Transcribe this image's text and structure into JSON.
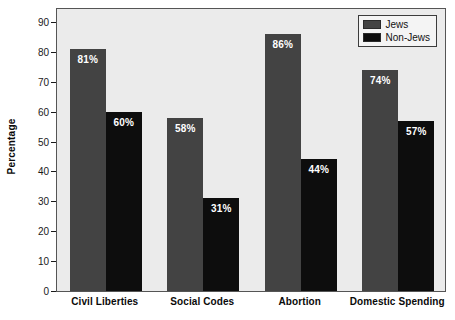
{
  "chart_data": {
    "type": "bar",
    "title": "",
    "xlabel": "",
    "ylabel": "Percentage",
    "ylim": [
      0,
      95
    ],
    "yticks": [
      0,
      10,
      20,
      30,
      40,
      50,
      60,
      70,
      80,
      90
    ],
    "ytick_labels": [
      "0",
      "10",
      "20",
      "30",
      "40",
      "50",
      "60",
      "70",
      "80",
      "90"
    ],
    "grid": false,
    "legend_position": "top-right",
    "categories": [
      "Civil Liberties",
      "Social Codes",
      "Abortion",
      "Domestic Spending"
    ],
    "series": [
      {
        "name": "Jews",
        "color": "#434343",
        "values": [
          81,
          58,
          86,
          74
        ],
        "value_labels": [
          "81%",
          "58%",
          "86%",
          "74%"
        ]
      },
      {
        "name": "Non-Jews",
        "color": "#0d0d0d",
        "values": [
          60,
          31,
          44,
          57
        ],
        "value_labels": [
          "60%",
          "31%",
          "44%",
          "57%"
        ]
      }
    ]
  },
  "colors": {
    "plot_background": "#ebebeb",
    "page_background": "#ffffff",
    "axis": "#555555",
    "text": "#0a0a0a",
    "bar_label_text": "#ffffff",
    "legend_background": "#f4f4f4",
    "legend_border": "#3c3c3c"
  }
}
